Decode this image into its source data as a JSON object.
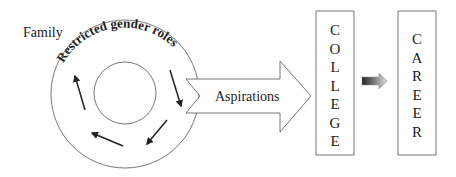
{
  "diagram": {
    "family_label": "Family",
    "cycle_label": "Restricted gender roles",
    "arrow_label": "Aspirations",
    "college_letters": [
      "C",
      "O",
      "L",
      "L",
      "E",
      "G",
      "E"
    ],
    "career_letters": [
      "C",
      "A",
      "R",
      "E",
      "E",
      "R"
    ],
    "colors": {
      "stroke": "#555555",
      "text": "#222222",
      "gradient_dark": "#222222",
      "gradient_light": "#dddddd"
    }
  }
}
